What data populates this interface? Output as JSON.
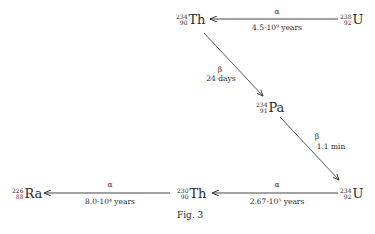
{
  "diagram": {
    "nodes": {
      "u238": {
        "mass": "238",
        "atomic": "92",
        "symbol": "U"
      },
      "th234": {
        "mass": "234",
        "atomic": "90",
        "symbol": "Th"
      },
      "pa234": {
        "mass": "234",
        "atomic": "91",
        "symbol": "Pa"
      },
      "u234": {
        "mass": "234",
        "atomic": "92",
        "symbol": "U"
      },
      "th230": {
        "mass": "230",
        "atomic": "90",
        "symbol": "Th"
      },
      "ra226": {
        "mass": "226",
        "atomic": "88",
        "symbol": "Ra"
      }
    },
    "edges": {
      "u238_th234": {
        "decay": "α",
        "time": "4.5·10⁹ years"
      },
      "th234_pa234": {
        "decay": "β",
        "time": "24 days"
      },
      "pa234_u234": {
        "decay": "β",
        "time": "1.1 min"
      },
      "u234_th230": {
        "decay": "α",
        "time": "2.67·10⁵ years"
      },
      "th230_ra226": {
        "decay": "α",
        "time": "8.0·10⁴ years"
      }
    },
    "caption": "Fig. 3"
  }
}
